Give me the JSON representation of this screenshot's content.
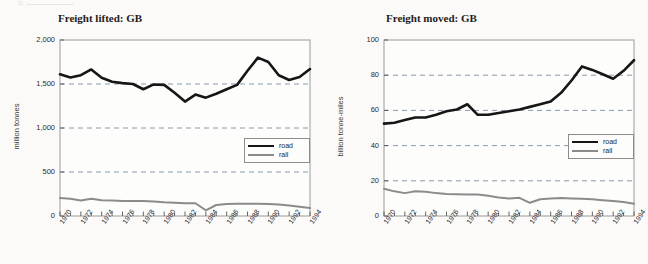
{
  "page": {
    "remnant_text": "○  —————"
  },
  "charts": [
    {
      "id": "freight-lifted",
      "title": "Freight lifted: GB",
      "ylabel": "million tonnes",
      "ytick_labels": [
        "0",
        "500",
        "1,000",
        "1,500",
        "2,000"
      ],
      "legend": [
        {
          "key": "road",
          "label": "road",
          "color": "#161616"
        },
        {
          "key": "rail",
          "label": "rail",
          "color": "#8b8b8b"
        }
      ],
      "xtick_labels": [
        "1970",
        "1972",
        "1974",
        "1976",
        "1978",
        "1980",
        "1982",
        "1984",
        "1986",
        "1988",
        "1990",
        "1992",
        "1994"
      ]
    },
    {
      "id": "freight-moved",
      "title": "Freight moved: GB",
      "ylabel": "billion tonne-miles",
      "ytick_labels": [
        "0",
        "20",
        "40",
        "60",
        "80",
        "100"
      ],
      "legend": [
        {
          "key": "road",
          "label": "road",
          "color": "#161616"
        },
        {
          "key": "rail",
          "label": "rail",
          "color": "#8b8b8b"
        }
      ],
      "xtick_labels": [
        "1970",
        "1972",
        "1974",
        "1976",
        "1978",
        "1980",
        "1982",
        "1984",
        "1986",
        "1988",
        "1990",
        "1992",
        "1994"
      ]
    }
  ],
  "chart_data": [
    {
      "type": "line",
      "title": "Freight lifted: GB",
      "xlabel": "",
      "ylabel": "million tonnes",
      "ylim": [
        0,
        2000
      ],
      "yticks": [
        0,
        500,
        1000,
        1500,
        2000
      ],
      "grid": true,
      "legend_position": "middle-right",
      "x": [
        1970,
        1971,
        1972,
        1973,
        1974,
        1975,
        1976,
        1977,
        1978,
        1979,
        1980,
        1981,
        1982,
        1983,
        1984,
        1985,
        1986,
        1987,
        1988,
        1989,
        1990,
        1991,
        1992,
        1993,
        1994
      ],
      "series": [
        {
          "name": "road",
          "color": "#161616",
          "values": [
            1610,
            1575,
            1600,
            1665,
            1570,
            1525,
            1510,
            1500,
            1440,
            1495,
            1490,
            1400,
            1300,
            1380,
            1345,
            1390,
            1440,
            1490,
            1650,
            1800,
            1750,
            1600,
            1545,
            1580,
            1670
          ]
        },
        {
          "name": "rail",
          "color": "#8b8b8b",
          "values": [
            205,
            195,
            175,
            195,
            180,
            175,
            170,
            170,
            170,
            165,
            155,
            150,
            145,
            145,
            65,
            125,
            135,
            140,
            140,
            140,
            135,
            130,
            120,
            105,
            90
          ]
        }
      ]
    },
    {
      "type": "line",
      "title": "Freight moved: GB",
      "xlabel": "",
      "ylabel": "billion tonne-miles",
      "ylim": [
        0,
        100
      ],
      "yticks": [
        0,
        20,
        40,
        60,
        80,
        100
      ],
      "grid": true,
      "legend_position": "middle-right",
      "x": [
        1970,
        1971,
        1972,
        1973,
        1974,
        1975,
        1976,
        1977,
        1978,
        1979,
        1980,
        1981,
        1982,
        1983,
        1984,
        1985,
        1986,
        1987,
        1988,
        1989,
        1990,
        1991,
        1992,
        1993,
        1994
      ],
      "series": [
        {
          "name": "road",
          "color": "#161616",
          "values": [
            52.5,
            53,
            54.5,
            56,
            56,
            57.5,
            59.5,
            60.5,
            63.5,
            57.5,
            57.5,
            58.5,
            59.5,
            60.5,
            62,
            63.5,
            65,
            70,
            77,
            85,
            83,
            80.5,
            78,
            82.5,
            88.5
          ]
        },
        {
          "name": "rail",
          "color": "#8b8b8b",
          "values": [
            15.5,
            14,
            13,
            14,
            13.8,
            13,
            12.5,
            12.3,
            12.2,
            12.2,
            11.5,
            10.5,
            10,
            10.3,
            7.5,
            9.5,
            10,
            10.2,
            10,
            9.8,
            9.5,
            9,
            8.5,
            8,
            7
          ]
        }
      ]
    }
  ]
}
